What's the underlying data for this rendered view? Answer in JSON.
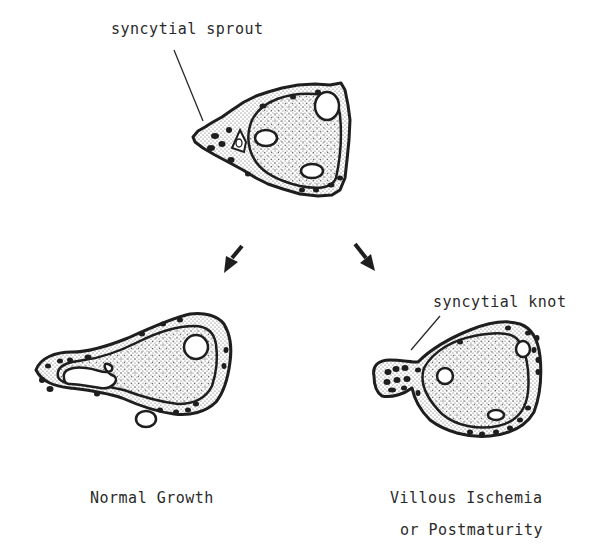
{
  "diagram": {
    "type": "schematic illustration of placental villi cross-sections",
    "top_villus": {
      "callout": "syncytial sprout"
    },
    "arrows": [
      {
        "direction": "down-left",
        "target": "normal_growth"
      },
      {
        "direction": "down-right",
        "target": "villous_ischemia"
      }
    ],
    "bottom_left_villus": {
      "caption": "Normal Growth"
    },
    "bottom_right_villus": {
      "callout": "syncytial knot",
      "caption_line1": "Villous Ischemia",
      "caption_line2": "or Postmaturity"
    },
    "colors": {
      "ink": "#1e1e1e",
      "background": "#ffffff",
      "stipple": "#5a5a5a"
    }
  }
}
